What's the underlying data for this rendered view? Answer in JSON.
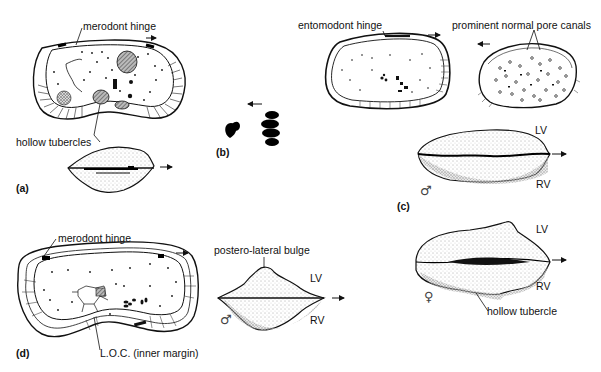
{
  "figure": {
    "panels": [
      {
        "id": "a",
        "label": "(a)",
        "annotations": [
          "merodont hinge",
          "hollow tubercles"
        ],
        "views": [
          "interior valve view",
          "dorsal view"
        ]
      },
      {
        "id": "b",
        "label": "(b)",
        "annotations": [],
        "views": [
          "muscle scar pattern"
        ]
      },
      {
        "id": "c",
        "label": "(c)",
        "annotations": [
          "entomodont hinge",
          "prominent normal pore canals"
        ],
        "valve_labels": [
          "LV",
          "RV"
        ],
        "sex_symbol": "♂",
        "views": [
          "interior valve view",
          "exterior valve view",
          "dorsal view"
        ]
      },
      {
        "id": "d",
        "label": "(d)",
        "annotations": [
          "merodont hinge",
          "L.O.C. (inner margin)",
          "postero-lateral bulge"
        ],
        "valve_labels": [
          "LV",
          "RV"
        ],
        "sex_symbol": "♂",
        "views": [
          "interior valve view",
          "dorsal view"
        ]
      },
      {
        "id": "c-female",
        "annotations": [
          "hollow tubercle"
        ],
        "valve_labels": [
          "LV",
          "RV"
        ],
        "sex_symbol": "♀",
        "views": [
          "dorsal view"
        ]
      }
    ],
    "labels": {
      "a_hinge": "merodont hinge",
      "a_tubercles": "hollow tubercles",
      "a_panel": "(a)",
      "b_panel": "(b)",
      "c_hinge": "entomodont hinge",
      "c_pores": "prominent normal pore canals",
      "c_panel": "(c)",
      "c_lv": "LV",
      "c_rv": "RV",
      "c_male": "♂",
      "d_hinge": "merodont hinge",
      "d_loc": "L.O.C. (inner margin)",
      "d_panel": "(d)",
      "d_bulge": "postero-lateral bulge",
      "d_lv": "LV",
      "d_rv": "RV",
      "d_male": "♂",
      "f_lv": "LV",
      "f_rv": "RV",
      "f_female": "♀",
      "f_tubercle": "hollow tubercle"
    },
    "arrows": {
      "direction_symbol": "→",
      "reverse_symbol": "←"
    }
  }
}
